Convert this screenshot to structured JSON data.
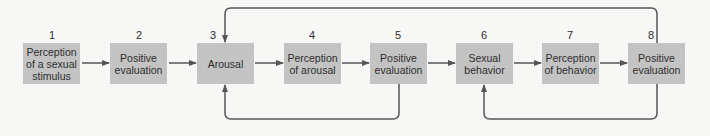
{
  "diagram": {
    "type": "flow",
    "steps": [
      {
        "number": "1",
        "label": "Perception of a sexual stimulus"
      },
      {
        "number": "2",
        "label": "Positive evaluation"
      },
      {
        "number": "3",
        "label": "Arousal"
      },
      {
        "number": "4",
        "label": "Perception of arousal"
      },
      {
        "number": "5",
        "label": "Positive evaluation"
      },
      {
        "number": "6",
        "label": "Sexual behavior"
      },
      {
        "number": "7",
        "label": "Perception of behavior"
      },
      {
        "number": "8",
        "label": "Positive evaluation"
      }
    ],
    "edges": [
      {
        "from": "1",
        "to": "2"
      },
      {
        "from": "2",
        "to": "3"
      },
      {
        "from": "3",
        "to": "4"
      },
      {
        "from": "4",
        "to": "5"
      },
      {
        "from": "5",
        "to": "6"
      },
      {
        "from": "6",
        "to": "7"
      },
      {
        "from": "7",
        "to": "8"
      },
      {
        "from": "5",
        "to": "3",
        "route": "feedback-below"
      },
      {
        "from": "8",
        "to": "3",
        "route": "feedback-above"
      },
      {
        "from": "8",
        "to": "6",
        "route": "feedback-below"
      }
    ],
    "colors": {
      "box_fill": "#c3c3c3",
      "line": "#555555",
      "text": "#2e2e2e",
      "background": "#f7f7f6"
    }
  }
}
